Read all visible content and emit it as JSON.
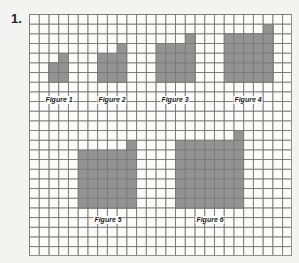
{
  "problem": {
    "number": "1."
  },
  "grid": {
    "cols": 27,
    "rows": 25,
    "line_color": "#8f8f8f",
    "fill_color": "#8a8a8a"
  },
  "figures": [
    {
      "label": "Figure 1",
      "square_size": 2,
      "col": 2,
      "row": 5,
      "extra_cell": {
        "col": 3,
        "row": 4
      },
      "label_pos": {
        "x": 59,
        "y": 100
      }
    },
    {
      "label": "Figure 2",
      "square_size": 3,
      "col": 7,
      "row": 4,
      "extra_cell": {
        "col": 9,
        "row": 3
      },
      "label_pos": {
        "x": 112,
        "y": 100
      }
    },
    {
      "label": "Figure 3",
      "square_size": 4,
      "col": 13,
      "row": 3,
      "extra_cell": {
        "col": 16,
        "row": 2
      },
      "label_pos": {
        "x": 175,
        "y": 100
      }
    },
    {
      "label": "Figure 4",
      "square_size": 5,
      "col": 20,
      "row": 2,
      "extra_cell": {
        "col": 24,
        "row": 1
      },
      "label_pos": {
        "x": 248,
        "y": 100
      }
    },
    {
      "label": "Figure 5",
      "square_size": 6,
      "col": 5,
      "row": 14,
      "extra_cell": {
        "col": 10,
        "row": 13
      },
      "label_pos": {
        "x": 108,
        "y": 220
      }
    },
    {
      "label": "Figure 6",
      "square_size": 7,
      "col": 15,
      "row": 13,
      "extra_cell": {
        "col": 21,
        "row": 12
      },
      "label_pos": {
        "x": 210,
        "y": 220
      }
    }
  ]
}
